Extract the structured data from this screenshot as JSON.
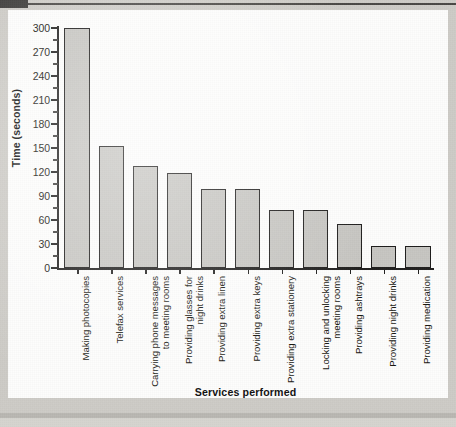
{
  "chart_data": {
    "type": "bar",
    "title": "",
    "xlabel": "Services performed",
    "ylabel": "Time (seconds)",
    "ylim": [
      0,
      300
    ],
    "ytick_step": 30,
    "yticks": [
      0,
      30,
      60,
      90,
      120,
      150,
      180,
      210,
      240,
      270,
      300
    ],
    "ytick_labels": [
      "0",
      "30",
      "60",
      "90",
      "120",
      "150",
      "180",
      "210",
      "240",
      "270",
      "300"
    ],
    "minor_ticks": true,
    "grid": false,
    "legend": false,
    "bar_color": "#c6c5c1",
    "bar_edge_color": "#1d1c1b",
    "categories": [
      "Making photocopies",
      "Telefax services",
      "Carrying phone messages to meeting rooms",
      "Providing glasses for night drinks",
      "Providing extra linen",
      "Providing extra keys",
      "Providing extra stationery",
      "Locking and unlocking meeting rooms",
      "Providing ashtrays",
      "Providing night drinks",
      "Providing medication"
    ],
    "category_lines": [
      [
        "Making photocopies"
      ],
      [
        "Telefax services"
      ],
      [
        "Carrying phone messages",
        "to meeting rooms"
      ],
      [
        "Providing glasses for",
        "night drinks"
      ],
      [
        "Providing extra linen"
      ],
      [
        "Providing extra keys"
      ],
      [
        "Providing extra stationery"
      ],
      [
        "Locking and unlocking",
        "meeting rooms"
      ],
      [
        "Providing ashtrays"
      ],
      [
        "Providing night drinks"
      ],
      [
        "Providing medication"
      ]
    ],
    "values": [
      300,
      153,
      128,
      119,
      99,
      99,
      73,
      73,
      55,
      28,
      28
    ]
  },
  "page": {
    "background_color": "#cdcbc6",
    "canvas_color": "#fdfdfc"
  }
}
